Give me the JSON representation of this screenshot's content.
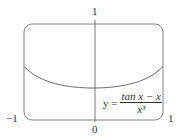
{
  "chart_data": {
    "type": "line",
    "title": "",
    "xlabel": "",
    "ylabel": "",
    "xlim": [
      -1,
      1
    ],
    "ylim": [
      0,
      1
    ],
    "x_tick_labels": [
      "-1",
      "0",
      "1"
    ],
    "y_tick_labels": [
      "1"
    ],
    "grid": false,
    "series": [
      {
        "name": "y = (tan x − x)/x³",
        "x": [
          -1,
          -0.75,
          -0.5,
          -0.25,
          0,
          0.25,
          0.5,
          0.75,
          1
        ],
        "values": [
          0.557,
          0.439,
          0.37,
          0.341,
          0.333,
          0.341,
          0.37,
          0.439,
          0.557
        ]
      }
    ],
    "annotations": [
      "y = (tan x − x)/x³"
    ]
  },
  "labels": {
    "y_top": "1",
    "x_left": "−1",
    "x_zero": "0",
    "x_right": "1",
    "eq_lhs": "y =",
    "eq_num": "tan x − x",
    "eq_den": "x³"
  }
}
